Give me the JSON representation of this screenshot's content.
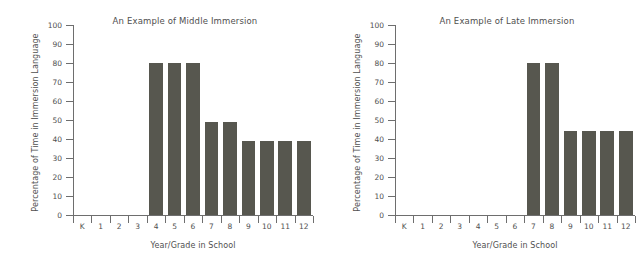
{
  "figure": {
    "background_color": "#ffffff",
    "bar_color": "#57574f",
    "axis_color": "#6e6e6e",
    "text_color": "#4f4f4f"
  },
  "chart_data": [
    {
      "type": "bar",
      "title": "An Example of Middle Immersion",
      "xlabel": "Year/Grade in School",
      "ylabel": "Percentage of Time in Immersion Language",
      "categories": [
        "K",
        "1",
        "2",
        "3",
        "4",
        "5",
        "6",
        "7",
        "8",
        "9",
        "10",
        "11",
        "12"
      ],
      "values": [
        0,
        0,
        0,
        0,
        80,
        80,
        80,
        49,
        49,
        39,
        39,
        39,
        39
      ],
      "ylim": [
        0,
        100
      ],
      "yticks": [
        0,
        10,
        20,
        30,
        40,
        50,
        60,
        70,
        80,
        90,
        100
      ],
      "ytick_labels": [
        "0",
        "10",
        "20",
        "30",
        "40",
        "50",
        "60",
        "70",
        "80",
        "90",
        "100"
      ],
      "grid": false,
      "legend": "none"
    },
    {
      "type": "bar",
      "title": "An Example of Late Immersion",
      "xlabel": "Year/Grade in School",
      "ylabel": "Percentage of Time in Immersion Language",
      "categories": [
        "K",
        "1",
        "2",
        "3",
        "4",
        "5",
        "6",
        "7",
        "8",
        "9",
        "10",
        "11",
        "12"
      ],
      "values": [
        0,
        0,
        0,
        0,
        0,
        0,
        0,
        80,
        80,
        44,
        44,
        44,
        44
      ],
      "ylim": [
        0,
        100
      ],
      "yticks": [
        0,
        10,
        20,
        30,
        40,
        50,
        60,
        70,
        80,
        90,
        100
      ],
      "ytick_labels": [
        "0",
        "10",
        "20",
        "30",
        "40",
        "50",
        "60",
        "70",
        "80",
        "90",
        "100"
      ],
      "grid": false,
      "legend": "none"
    }
  ]
}
